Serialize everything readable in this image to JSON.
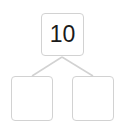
{
  "diagram": {
    "type": "number-bond",
    "whole": {
      "value": "10"
    },
    "parts": [
      {
        "value": ""
      },
      {
        "value": ""
      }
    ],
    "colors": {
      "border": "#d2d2d2",
      "text": "#1a1a1a",
      "connector": "#d2d2d2"
    }
  }
}
